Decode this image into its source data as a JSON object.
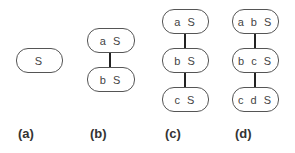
{
  "diagrams": [
    {
      "label": "(a)",
      "nodes": [
        "S"
      ]
    },
    {
      "label": "(b)",
      "nodes": [
        "a S",
        "b S"
      ]
    },
    {
      "label": "(c)",
      "nodes": [
        "a S",
        "b S",
        "c S"
      ]
    },
    {
      "label": "(d)",
      "nodes": [
        "a b S",
        "b c S",
        "c d S"
      ]
    }
  ]
}
